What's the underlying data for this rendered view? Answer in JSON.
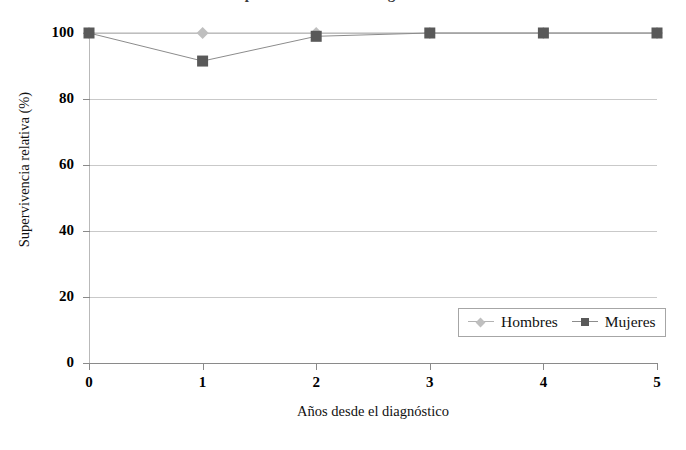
{
  "title_sliver": "Supervivencia relativa según el sexo",
  "chart_data": {
    "type": "line",
    "title": "",
    "xlabel": "Años desde el diagnóstico",
    "ylabel": "Supervivencia relativa (%)",
    "x": [
      0,
      1,
      2,
      3,
      4,
      5
    ],
    "xticklabels": [
      "0",
      "1",
      "2",
      "3",
      "4",
      "5"
    ],
    "yticks": [
      0,
      20,
      40,
      60,
      80,
      100
    ],
    "yticklabels": [
      "0",
      "20",
      "40",
      "60",
      "80",
      "100"
    ],
    "xlim": [
      0,
      5
    ],
    "ylim": [
      0,
      100
    ],
    "grid": "horizontal",
    "legend_position": "bottom-right",
    "series": [
      {
        "name": "Hombres",
        "marker": "diamond",
        "color": "#bfbfbf",
        "line_color": "#b3b3b3",
        "values": [
          100,
          100,
          100,
          100,
          100,
          100
        ]
      },
      {
        "name": "Mujeres",
        "marker": "square",
        "color": "#595959",
        "line_color": "#8c8c8c",
        "values": [
          100,
          91.5,
          99,
          100,
          100,
          100
        ]
      }
    ]
  },
  "colors": {
    "gridline": "#c9c9c9",
    "axis": "#8a8a8a",
    "legend_border": "#a6a6a6",
    "background": "#ffffff"
  }
}
